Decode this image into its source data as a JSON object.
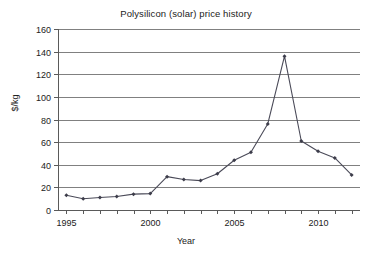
{
  "chart_data": {
    "type": "line",
    "title": "Polysilicon (solar) price history",
    "xlabel": "Year",
    "ylabel": "$/kg",
    "grid": "horizontal",
    "legend": "none",
    "xlim": [
      1994.5,
      2012.5
    ],
    "ylim": [
      0,
      160
    ],
    "y_ticks": [
      0,
      20,
      40,
      60,
      80,
      100,
      120,
      140,
      160
    ],
    "y_tick_labels": [
      "0",
      "20",
      "40",
      "60",
      "80",
      "100",
      "120",
      "140",
      "160"
    ],
    "x_ticks": [
      1995,
      1996,
      1997,
      1998,
      1999,
      2000,
      2001,
      2002,
      2003,
      2004,
      2005,
      2006,
      2007,
      2008,
      2009,
      2010,
      2011,
      2012
    ],
    "x_tick_labels_shown": [
      "1995",
      "2000",
      "2005",
      "2010"
    ],
    "x_labeled_ticks": [
      1995,
      2000,
      2005,
      2010
    ],
    "x": [
      1995,
      1996,
      1997,
      1998,
      1999,
      2000,
      2001,
      2002,
      2003,
      2004,
      2005,
      2006,
      2007,
      2008,
      2009,
      2010,
      2011,
      2012
    ],
    "values": [
      13,
      10,
      11,
      12,
      14,
      14.5,
      29.5,
      27,
      26,
      32,
      44,
      51,
      76,
      136,
      61,
      52,
      46,
      31
    ],
    "series": [
      {
        "name": "Polysilicon price",
        "values": [
          13,
          10,
          11,
          12,
          14,
          14.5,
          29.5,
          27,
          26,
          32,
          44,
          51,
          76,
          136,
          61,
          52,
          46,
          31
        ]
      }
    ],
    "colors": {
      "line": "#4a4a58",
      "marker": "#3c3c4a",
      "grid": "#808080",
      "axis": "#5a5a5a",
      "background": "#ffffff",
      "text": "#222222"
    }
  }
}
